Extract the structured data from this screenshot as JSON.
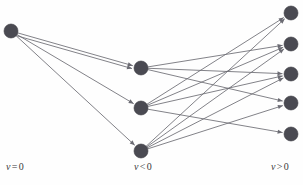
{
  "figure": {
    "width": 303,
    "height": 185,
    "background_color": "#fefefe",
    "node_color": "#4a4a52",
    "node_stroke_color": "#3a3a42",
    "edge_color": "#6b6b73",
    "label_color": "#3a3a3a",
    "node_radius": 7
  },
  "labels": {
    "left": {
      "var": "v",
      "op": "=",
      "value": "0",
      "text": "v = 0",
      "x": 6,
      "y": 167
    },
    "middle": {
      "var": "v",
      "op": "<",
      "value": "0",
      "text": "v < 0",
      "x": 134,
      "y": 167
    },
    "right": {
      "var": "v",
      "op": ">",
      "value": "0",
      "text": "v > 0",
      "x": 271,
      "y": 167
    }
  },
  "chart_data": {
    "type": "diagram",
    "title": "",
    "columns": [
      {
        "id": "left",
        "label": "v = 0",
        "x": 11
      },
      {
        "id": "middle",
        "label": "v < 0",
        "x": 141
      },
      {
        "id": "right",
        "label": "v > 0",
        "x": 291
      }
    ],
    "nodes": [
      {
        "id": "L1",
        "column": "left",
        "x": 11,
        "y": 31
      },
      {
        "id": "M1",
        "column": "middle",
        "x": 141,
        "y": 68
      },
      {
        "id": "M2",
        "column": "middle",
        "x": 141,
        "y": 108
      },
      {
        "id": "M3",
        "column": "middle",
        "x": 141,
        "y": 151
      },
      {
        "id": "R1",
        "column": "right",
        "x": 291,
        "y": 13
      },
      {
        "id": "R2",
        "column": "right",
        "x": 291,
        "y": 44
      },
      {
        "id": "R3",
        "column": "right",
        "x": 291,
        "y": 74
      },
      {
        "id": "R4",
        "column": "right",
        "x": 291,
        "y": 103
      },
      {
        "id": "R5",
        "column": "right",
        "x": 291,
        "y": 134
      }
    ],
    "edges": [
      {
        "from": "L1",
        "to": "M1"
      },
      {
        "from": "L1",
        "to": "M1",
        "offset": 3
      },
      {
        "from": "L1",
        "to": "M2"
      },
      {
        "from": "L1",
        "to": "M3"
      },
      {
        "from": "M1",
        "to": "R2"
      },
      {
        "from": "M1",
        "to": "R3"
      },
      {
        "from": "M1",
        "to": "R4"
      },
      {
        "from": "M2",
        "to": "R1"
      },
      {
        "from": "M2",
        "to": "R2"
      },
      {
        "from": "M2",
        "to": "R3"
      },
      {
        "from": "M2",
        "to": "R5"
      },
      {
        "from": "M3",
        "to": "R1"
      },
      {
        "from": "M3",
        "to": "R2"
      },
      {
        "from": "M3",
        "to": "R3"
      },
      {
        "from": "M3",
        "to": "R4"
      }
    ]
  }
}
